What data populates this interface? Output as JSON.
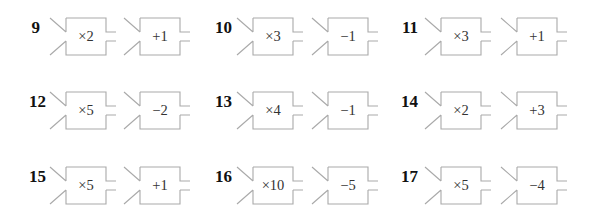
{
  "problems": [
    {
      "number": "9",
      "machines": [
        {
          "op": "×2"
        },
        {
          "op": "+1"
        }
      ]
    },
    {
      "number": "10",
      "machines": [
        {
          "op": "×3"
        },
        {
          "op": "−1"
        }
      ]
    },
    {
      "number": "11",
      "machines": [
        {
          "op": "×3"
        },
        {
          "op": "+1"
        }
      ]
    },
    {
      "number": "12",
      "machines": [
        {
          "op": "×5"
        },
        {
          "op": "−2"
        }
      ]
    },
    {
      "number": "13",
      "machines": [
        {
          "op": "×4"
        },
        {
          "op": "−1"
        }
      ]
    },
    {
      "number": "14",
      "machines": [
        {
          "op": "×2"
        },
        {
          "op": "+3"
        }
      ]
    },
    {
      "number": "15",
      "machines": [
        {
          "op": "×5"
        },
        {
          "op": "+1"
        }
      ]
    },
    {
      "number": "16",
      "machines": [
        {
          "op": "×10"
        },
        {
          "op": "−5"
        }
      ]
    },
    {
      "number": "17",
      "machines": [
        {
          "op": "×5"
        },
        {
          "op": "−4"
        }
      ]
    }
  ],
  "colors": {
    "outline": "#a9a9a9",
    "text": "#333333",
    "number": "#111111"
  }
}
